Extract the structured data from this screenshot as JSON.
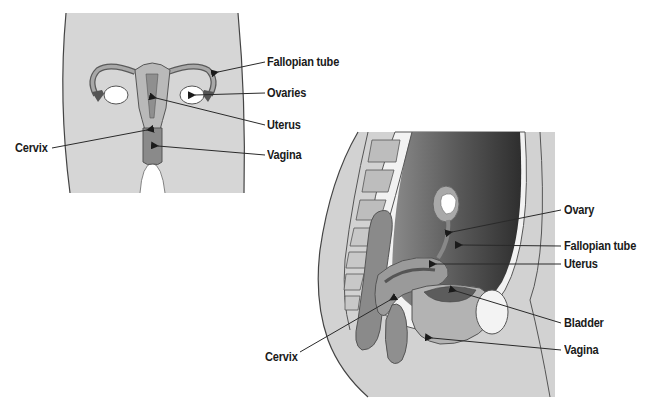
{
  "front_view": {
    "labels": [
      {
        "id": "fallopian-tube",
        "text": "Fallopian tube",
        "x": 267,
        "y": 55
      },
      {
        "id": "ovaries",
        "text": "Ovaries",
        "x": 267,
        "y": 86
      },
      {
        "id": "uterus",
        "text": "Uterus",
        "x": 267,
        "y": 118
      },
      {
        "id": "cervix",
        "text": "Cervix",
        "x": 15,
        "y": 141
      },
      {
        "id": "vagina",
        "text": "Vagina",
        "x": 267,
        "y": 148
      }
    ]
  },
  "sagittal_view": {
    "labels": [
      {
        "id": "ovary",
        "text": "Ovary",
        "x": 564,
        "y": 203
      },
      {
        "id": "fallopian-tube",
        "text": "Fallopian tube",
        "x": 564,
        "y": 239
      },
      {
        "id": "uterus",
        "text": "Uterus",
        "x": 564,
        "y": 257
      },
      {
        "id": "bladder",
        "text": "Bladder",
        "x": 564,
        "y": 316
      },
      {
        "id": "vagina",
        "text": "Vagina",
        "x": 564,
        "y": 343
      },
      {
        "id": "cervix",
        "text": "Cervix",
        "x": 265,
        "y": 350
      }
    ]
  },
  "colors": {
    "skin": "#d4d4d4",
    "organ_light": "#b8b8b8",
    "organ_mid": "#8e8e8e",
    "organ_dark": "#6b6b6b",
    "cavity_dark": "#3a3a3a",
    "outline": "#4a4a4a",
    "leader_line": "#2a2a2a"
  }
}
